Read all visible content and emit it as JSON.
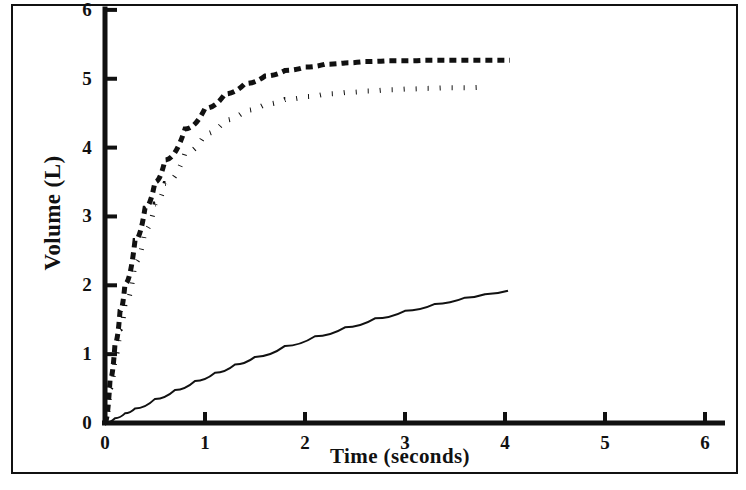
{
  "chart_data": {
    "type": "line",
    "title": "",
    "xlabel": "Time (seconds)",
    "ylabel": "Volume (L)",
    "xlim": [
      0,
      6.2
    ],
    "ylim": [
      0,
      6.05
    ],
    "xticks": [
      0,
      1,
      2,
      3,
      4,
      5,
      6
    ],
    "xtick_labels": [
      "0",
      "1",
      "2",
      "3",
      "4",
      "5",
      "6"
    ],
    "yticks": [
      0,
      1,
      2,
      3,
      4,
      5,
      6
    ],
    "ytick_labels": [
      "0",
      "1",
      "2",
      "3",
      "4",
      "5",
      "6"
    ],
    "grid": false,
    "legend": "none",
    "axis_color": "#111111",
    "background": "#ffffff",
    "series": [
      {
        "name": "upper-dashed-curve",
        "style": "dashed",
        "color": "#111111",
        "line_width": 5,
        "dash_pattern": "7,5",
        "x": [
          0.0,
          0.05,
          0.1,
          0.15,
          0.2,
          0.3,
          0.4,
          0.5,
          0.6,
          0.8,
          1.0,
          1.2,
          1.4,
          1.6,
          1.8,
          2.0,
          2.2,
          2.4,
          2.6,
          2.8,
          3.0,
          3.2,
          3.4,
          3.6,
          3.8,
          4.0,
          4.05
        ],
        "y": [
          0.0,
          0.62,
          1.15,
          1.62,
          2.02,
          2.65,
          3.12,
          3.5,
          3.82,
          4.27,
          4.57,
          4.78,
          4.93,
          5.04,
          5.12,
          5.17,
          5.21,
          5.23,
          5.25,
          5.26,
          5.26,
          5.27,
          5.27,
          5.27,
          5.27,
          5.27,
          5.27
        ]
      },
      {
        "name": "middle-dotted-curve",
        "style": "dotted",
        "color": "#111111",
        "line_width": 5,
        "dash_pattern": "1,11",
        "x": [
          0.0,
          0.05,
          0.1,
          0.15,
          0.2,
          0.3,
          0.4,
          0.5,
          0.6,
          0.8,
          1.0,
          1.2,
          1.4,
          1.6,
          1.8,
          2.0,
          2.2,
          2.4,
          2.6,
          2.8,
          3.0,
          3.2,
          3.4,
          3.6,
          3.78
        ],
        "y": [
          0.0,
          0.5,
          0.95,
          1.36,
          1.73,
          2.33,
          2.8,
          3.18,
          3.48,
          3.92,
          4.2,
          4.4,
          4.54,
          4.63,
          4.7,
          4.74,
          4.78,
          4.8,
          4.82,
          4.84,
          4.85,
          4.86,
          4.87,
          4.87,
          4.88
        ]
      },
      {
        "name": "lower-solid-curve",
        "style": "solid",
        "color": "#111111",
        "line_width": 2,
        "dash_pattern": "",
        "x": [
          0.0,
          0.1,
          0.2,
          0.3,
          0.5,
          0.7,
          0.9,
          1.1,
          1.3,
          1.5,
          1.8,
          2.1,
          2.4,
          2.7,
          3.0,
          3.3,
          3.6,
          3.8,
          4.03
        ],
        "y": [
          0.0,
          0.07,
          0.14,
          0.21,
          0.35,
          0.48,
          0.61,
          0.73,
          0.85,
          0.96,
          1.12,
          1.26,
          1.39,
          1.52,
          1.63,
          1.73,
          1.82,
          1.87,
          1.92
        ]
      }
    ]
  }
}
